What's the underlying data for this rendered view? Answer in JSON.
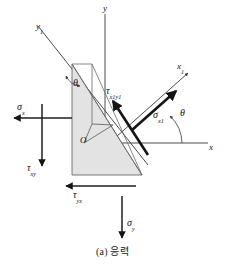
{
  "figure": {
    "caption": "(a) 응력",
    "caption_prefix": "(a)",
    "caption_text": "응력",
    "background_color": "#ffffff",
    "wedge_fill": "#e3e3e3",
    "line_color": "#3a3a3a",
    "arrow_color": "#141414"
  },
  "axes": [
    {
      "id": "y",
      "label": "y",
      "sub": "",
      "kind": "vertical-axis",
      "orientation": "up"
    },
    {
      "id": "x",
      "label": "x",
      "sub": "",
      "kind": "horizontal-axis",
      "orientation": "right"
    },
    {
      "id": "y1",
      "label": "y",
      "sub": "1",
      "kind": "rotated-axis",
      "orientation": "upper-left"
    },
    {
      "id": "x1",
      "label": "x",
      "sub": "1",
      "kind": "rotated-axis",
      "orientation": "upper-right"
    }
  ],
  "origin": {
    "label": "O",
    "name": "origin-point"
  },
  "angles": [
    {
      "id": "theta-wedge",
      "label": "θ",
      "description": "angle at wedge apex between y axis and y1 axis"
    },
    {
      "id": "theta-axis",
      "label": "θ",
      "description": "angle between x axis and x1 axis"
    }
  ],
  "stresses": [
    {
      "id": "sigma-x",
      "symbol": "σ",
      "sub": "x",
      "label": "σx",
      "direction": "left",
      "type": "normal"
    },
    {
      "id": "sigma-y",
      "symbol": "σ",
      "sub": "y",
      "label": "σy",
      "direction": "down",
      "type": "normal"
    },
    {
      "id": "tau-xy",
      "symbol": "τ",
      "sub": "xy",
      "label": "τxy",
      "direction": "down",
      "type": "shear"
    },
    {
      "id": "tau-yx",
      "symbol": "τ",
      "sub": "yx",
      "label": "τyx",
      "direction": "left",
      "type": "shear"
    },
    {
      "id": "sigma-x1",
      "symbol": "σ",
      "sub": "x1",
      "label": "σx1",
      "direction": "upper-right",
      "type": "normal-inclined"
    },
    {
      "id": "tau-x1y1",
      "symbol": "τ",
      "sub": "x1y1",
      "label": "τx1y1",
      "direction": "upper-left",
      "type": "shear-inclined"
    }
  ],
  "labels": {
    "y_axis": "y",
    "x_axis": "x",
    "y1_axis_base": "y",
    "y1_axis_sub": "1",
    "x1_axis_base": "x",
    "x1_axis_sub": "1",
    "origin": "O",
    "theta_wedge": "θ",
    "theta_axis": "θ",
    "sigma_x_base": "σ",
    "sigma_x_sub": "x",
    "sigma_y_base": "σ",
    "sigma_y_sub": "y",
    "tau_xy_base": "τ",
    "tau_xy_sub": "xy",
    "tau_yx_base": "τ",
    "tau_yx_sub": "yx",
    "sigma_x1_base": "σ",
    "sigma_x1_sub": "x1",
    "tau_x1y1_base": "τ",
    "tau_x1y1_sub": "x1y1"
  }
}
